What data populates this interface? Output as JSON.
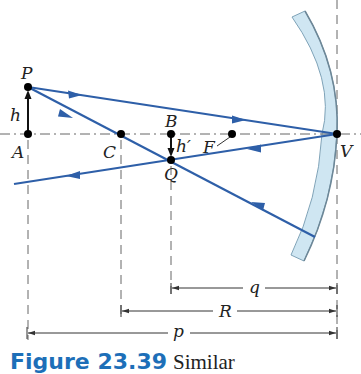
{
  "figure": {
    "caption_number": "Figure 23.39",
    "caption_text": "Similar"
  },
  "colors": {
    "ray": "#2e5fa8",
    "mirror_fill": "#cfe6f2",
    "mirror_edge": "#7fa3b8",
    "axis": "#555555",
    "caption_blue": "#1d6fb8",
    "point": "#000000"
  },
  "points": {
    "P": "P",
    "A": "A",
    "C": "C",
    "B": "B",
    "F": "F",
    "Q": "Q",
    "V": "V"
  },
  "labels": {
    "h": "h",
    "h_prime": "h′"
  },
  "dimensions": {
    "q": "q",
    "R": "R",
    "p": "p"
  }
}
